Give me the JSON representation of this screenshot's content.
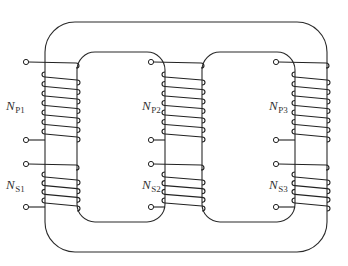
{
  "diagram": {
    "type": "three-limb transformer core with primary and secondary windings",
    "limbs": [
      {
        "id": "limb-1",
        "primary": {
          "label_main": "N",
          "label_sub": "P1",
          "turns": 7
        },
        "secondary": {
          "label_main": "N",
          "label_sub": "S1",
          "turns": 4
        }
      },
      {
        "id": "limb-2",
        "primary": {
          "label_main": "N",
          "label_sub": "P2",
          "turns": 7
        },
        "secondary": {
          "label_main": "N",
          "label_sub": "S2",
          "turns": 4
        }
      },
      {
        "id": "limb-3",
        "primary": {
          "label_main": "N",
          "label_sub": "P3",
          "turns": 7
        },
        "secondary": {
          "label_main": "N",
          "label_sub": "S3",
          "turns": 4
        }
      }
    ],
    "colors": {
      "line": "#222222",
      "background": "#ffffff"
    }
  }
}
